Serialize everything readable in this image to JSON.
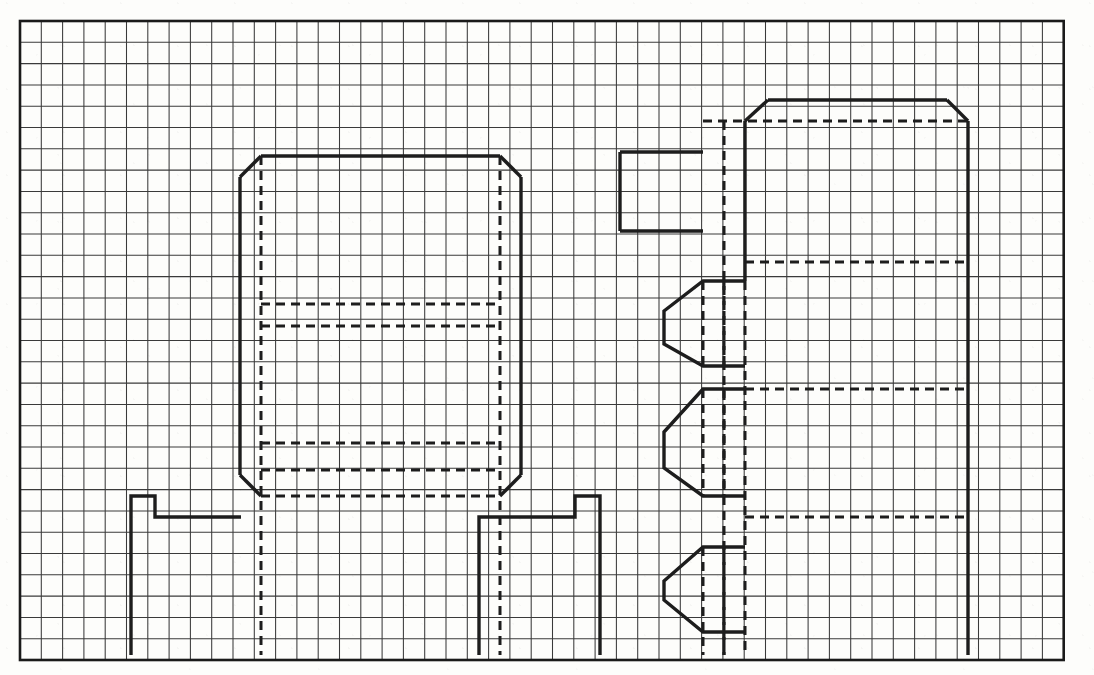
{
  "drawing": {
    "title": "Graph-paper floor-plan sketch",
    "medium": "grid paper technical sketch",
    "background_color": "#fdfdfb",
    "ink_color": "#1d1d1d",
    "grid_color": "#3a3a3a",
    "border_color": "#1a1a1a"
  },
  "grid": {
    "label": "graph-paper-grid",
    "origin_x": 20,
    "origin_y": 21,
    "cell_size": 21.3,
    "columns": 49,
    "rows": 30,
    "line_width": 1.05,
    "border_line_width": 2.6,
    "grid_on": true
  },
  "layers": {
    "solid_label": "solid-wall-line",
    "dashed_label": "hidden-dashed-line",
    "solid_width": 3.4,
    "dashed_width": 3.0,
    "dash_pattern": "9 6"
  },
  "shapes": [
    {
      "id": "left-octagon-room",
      "name": "left-chamfered-room",
      "description": "Large rectangle with four chamfered corners occupying the left-centre of the sheet",
      "bounds": {
        "x1": 240,
        "y1": 156,
        "x2": 521,
        "y2": 496
      },
      "chamfer": 21,
      "solid_outline": true
    },
    {
      "id": "left-room-inner-dashes",
      "name": "left-room-hidden-lines",
      "description": "Horizontal hidden lines crossing the left room and two vertical hidden lines running to the bottom border"
    },
    {
      "id": "right-tall-room",
      "name": "right-chamfered-tall-room",
      "description": "Tall rectangle with chamfered top corners on the right of the sheet, open to the bottom border",
      "bounds": {
        "x1": 745,
        "y1": 100,
        "x2": 968,
        "y2": 655
      },
      "chamfer": 21,
      "solid_outline": true
    },
    {
      "id": "small-top-box",
      "name": "small-top-left-box",
      "description": "Small open rectangle left of the right room",
      "bounds": {
        "x1": 620,
        "y1": 152,
        "x2": 702,
        "y2": 231
      }
    },
    {
      "id": "pointed-bay-upper",
      "name": "upper-pointed-bay",
      "description": "Narrow bay with angled left point, upper of three",
      "bounds": {
        "x1": 664,
        "y1": 281,
        "x2": 745,
        "y2": 366
      }
    },
    {
      "id": "pointed-bay-middle",
      "name": "middle-pointed-bay",
      "description": "Narrow bay with angled left point, middle of three",
      "bounds": {
        "x1": 664,
        "y1": 389,
        "x2": 745,
        "y2": 496
      }
    },
    {
      "id": "pointed-bay-lower",
      "name": "lower-pointed-bay",
      "description": "Narrow bay with angled left point, lowest of three, meets bottom border",
      "bounds": {
        "x1": 664,
        "y1": 547,
        "x2": 745,
        "y2": 632
      }
    },
    {
      "id": "left-step",
      "name": "bottom-left-step-wall",
      "description": "Stepped wall at lower-left running down to the bottom border"
    },
    {
      "id": "centre-step",
      "name": "bottom-centre-step-wall",
      "description": "Stepped wall at lower-centre running down to the bottom border"
    }
  ],
  "annotations": {
    "has_text_labels": false,
    "has_dimensions": false,
    "note": ""
  }
}
